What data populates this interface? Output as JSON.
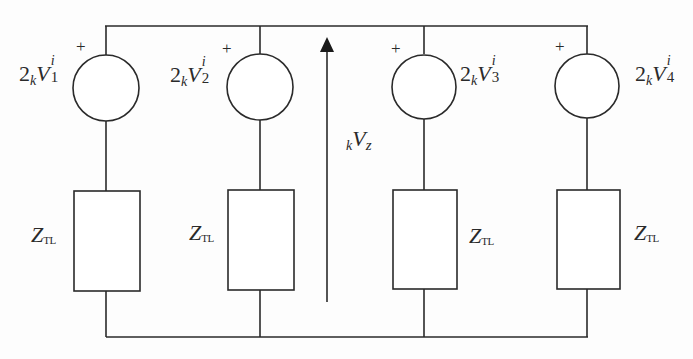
{
  "diagram": {
    "type": "circuit",
    "colors": {
      "line": "#2a2a2a",
      "background": "#fdfdfd"
    },
    "branches": [
      {
        "id": 1,
        "source": {
          "coef": "2",
          "pre_sub": "k",
          "symbol": "V",
          "sup": "i",
          "sub": "1",
          "polarity": "+"
        },
        "impedance": {
          "symbol": "Z",
          "sub": "TL"
        }
      },
      {
        "id": 2,
        "source": {
          "coef": "2",
          "pre_sub": "k",
          "symbol": "V",
          "sup": "i",
          "sub": "2",
          "polarity": "+"
        },
        "impedance": {
          "symbol": "Z",
          "sub": "TL"
        }
      },
      {
        "id": 3,
        "source": {
          "coef": "2",
          "pre_sub": "k",
          "symbol": "V",
          "sup": "i",
          "sub": "3",
          "polarity": "+"
        },
        "impedance": {
          "symbol": "Z",
          "sub": "TL"
        }
      },
      {
        "id": 4,
        "source": {
          "coef": "2",
          "pre_sub": "k",
          "symbol": "V",
          "sup": "i",
          "sub": "4",
          "polarity": "+"
        },
        "impedance": {
          "symbol": "Z",
          "sub": "TL"
        }
      }
    ],
    "node_voltage": {
      "pre_sub": "k",
      "symbol": "V",
      "sub": "z",
      "direction": "up"
    }
  }
}
